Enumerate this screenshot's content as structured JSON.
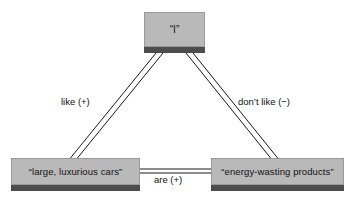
{
  "diagram": {
    "type": "semantic-network",
    "colors": {
      "node_fill": "#b9b9b9",
      "node_border": "#9a9a9a",
      "node_shadow": "#4d4d4d",
      "edge": "#1a1a1a",
      "background": "#ffffff",
      "text": "#111111"
    },
    "nodes": [
      {
        "id": "self",
        "label": "“I”",
        "position": "top-center"
      },
      {
        "id": "cars",
        "label": "“large, luxurious cars”",
        "position": "bottom-left"
      },
      {
        "id": "products",
        "label": "“energy-wasting products”",
        "position": "bottom-right"
      }
    ],
    "edges": [
      {
        "id": "self-cars",
        "from": "self",
        "to": "cars",
        "label": "like (+)",
        "sign": "+",
        "style": "double-line"
      },
      {
        "id": "self-products",
        "from": "self",
        "to": "products",
        "label": "don’t like (−)",
        "sign": "−",
        "style": "double-line"
      },
      {
        "id": "cars-products",
        "from": "cars",
        "to": "products",
        "label": "are (+)",
        "sign": "+",
        "style": "double-line"
      }
    ]
  }
}
